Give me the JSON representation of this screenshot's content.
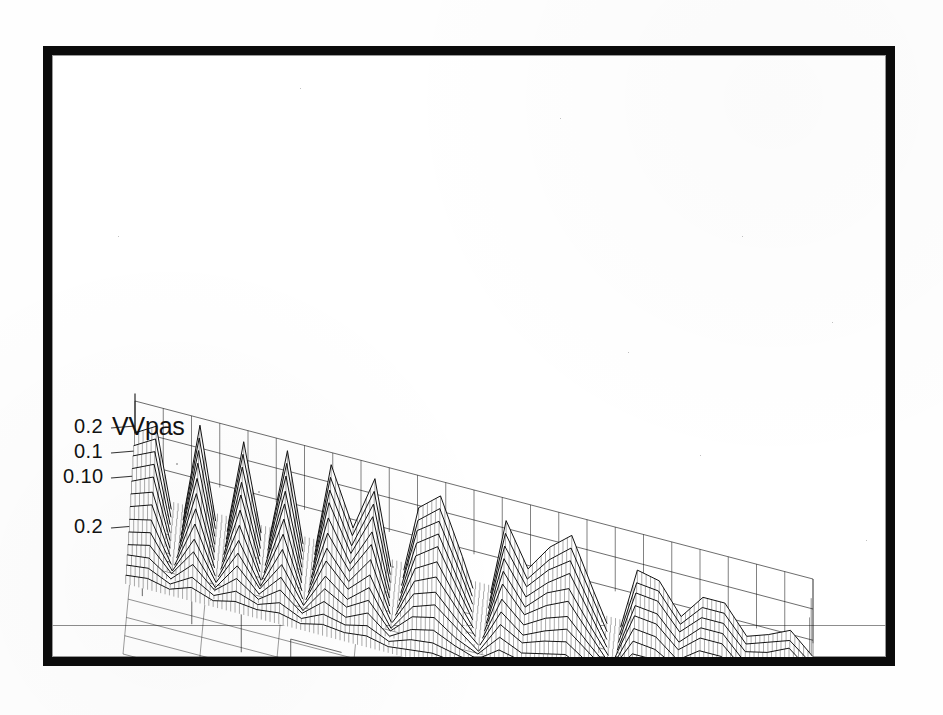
{
  "figure": {
    "axis_title": "VVpas",
    "frame_style": "thick-black-border",
    "background_color": "#ffffff",
    "ink_color": "#121212"
  },
  "chart_data": {
    "type": "line",
    "render_style": "3d-waterfall-mesh-surface",
    "title": "VVpas",
    "xlabel": "",
    "ylabel": "",
    "zlabel": "VVpas",
    "grid": true,
    "legend": "none",
    "projection": "oblique-3d",
    "z_axis": {
      "labels": [
        "0.2",
        "0.1",
        "0.10",
        "0.2"
      ],
      "values": [
        0.2,
        0.1,
        0.0,
        -0.2
      ],
      "zlim": [
        -0.2,
        0.2
      ]
    },
    "y_axis": {
      "labels": [
        "10",
        "20",
        "30",
        "40",
        "50",
        "60",
        "70",
        "80",
        "90",
        "100",
        "110",
        "120",
        "130"
      ],
      "values": [
        10,
        20,
        30,
        40,
        50,
        60,
        70,
        80,
        90,
        100,
        110,
        120,
        130
      ],
      "ylim": [
        10,
        130
      ],
      "tick_step": 10
    },
    "series_count": 13,
    "series": [
      {
        "name": "10",
        "values": [
          0.0,
          0.01,
          -0.01,
          0.02,
          -0.01,
          0.01,
          0.0,
          0.01,
          -0.01,
          0.01,
          0.0,
          0.01,
          -0.01,
          0.0,
          0.01,
          0.0,
          -0.01,
          0.01,
          0.0,
          0.0,
          0.01,
          0.0,
          -0.01,
          0.0,
          0.01,
          0.0,
          0.0,
          0.01,
          0.0,
          0.0,
          0.0,
          0.0
        ]
      },
      {
        "name": "20",
        "values": [
          0.01,
          0.02,
          -0.02,
          0.03,
          -0.02,
          0.02,
          -0.01,
          0.02,
          -0.02,
          0.02,
          0.0,
          0.02,
          -0.02,
          0.01,
          0.02,
          0.0,
          -0.02,
          0.02,
          0.0,
          0.01,
          0.02,
          0.0,
          -0.01,
          0.01,
          0.01,
          0.0,
          0.01,
          0.01,
          0.0,
          0.0,
          0.01,
          0.0
        ]
      },
      {
        "name": "30",
        "values": [
          0.02,
          0.03,
          -0.03,
          0.05,
          -0.03,
          0.04,
          -0.02,
          0.04,
          -0.03,
          0.04,
          0.0,
          0.04,
          -0.03,
          0.02,
          0.04,
          0.0,
          -0.03,
          0.03,
          0.01,
          0.02,
          0.03,
          0.0,
          -0.02,
          0.02,
          0.02,
          0.0,
          0.02,
          0.02,
          0.0,
          0.01,
          0.01,
          0.0
        ]
      },
      {
        "name": "40",
        "values": [
          0.03,
          0.05,
          -0.04,
          0.07,
          -0.05,
          0.06,
          -0.03,
          0.06,
          -0.05,
          0.06,
          0.01,
          0.06,
          -0.04,
          0.04,
          0.06,
          0.0,
          -0.04,
          0.05,
          0.01,
          0.03,
          0.05,
          0.01,
          -0.03,
          0.03,
          0.03,
          0.01,
          0.03,
          0.03,
          0.0,
          0.01,
          0.02,
          0.0
        ]
      },
      {
        "name": "50",
        "values": [
          0.05,
          0.07,
          -0.06,
          0.09,
          -0.06,
          0.08,
          -0.04,
          0.08,
          -0.06,
          0.08,
          0.01,
          0.08,
          -0.06,
          0.05,
          0.08,
          0.01,
          -0.06,
          0.07,
          0.02,
          0.05,
          0.07,
          0.01,
          -0.04,
          0.05,
          0.04,
          0.01,
          0.04,
          0.04,
          0.01,
          0.02,
          0.03,
          0.0
        ]
      },
      {
        "name": "60",
        "values": [
          0.07,
          0.09,
          -0.08,
          0.12,
          -0.08,
          0.1,
          -0.06,
          0.11,
          -0.08,
          0.11,
          0.02,
          0.1,
          -0.07,
          0.07,
          0.1,
          0.01,
          -0.07,
          0.09,
          0.02,
          0.06,
          0.09,
          0.02,
          -0.05,
          0.06,
          0.06,
          0.01,
          0.05,
          0.05,
          0.01,
          0.02,
          0.04,
          0.01
        ]
      },
      {
        "name": "70",
        "values": [
          0.09,
          0.12,
          -0.1,
          0.15,
          -0.1,
          0.13,
          -0.07,
          0.14,
          -0.1,
          0.13,
          0.02,
          0.13,
          -0.09,
          0.09,
          0.13,
          0.02,
          -0.09,
          0.11,
          0.03,
          0.08,
          0.11,
          0.02,
          -0.06,
          0.08,
          0.07,
          0.02,
          0.07,
          0.07,
          0.01,
          0.03,
          0.05,
          0.01
        ]
      },
      {
        "name": "80",
        "values": [
          0.11,
          0.14,
          -0.12,
          0.18,
          -0.12,
          0.16,
          -0.09,
          0.17,
          -0.12,
          0.16,
          0.03,
          0.16,
          -0.11,
          0.11,
          0.16,
          0.02,
          -0.11,
          0.14,
          0.04,
          0.1,
          0.14,
          0.03,
          -0.08,
          0.1,
          0.09,
          0.02,
          0.08,
          0.08,
          0.02,
          0.04,
          0.06,
          0.01
        ]
      },
      {
        "name": "90",
        "values": [
          0.13,
          0.17,
          -0.14,
          0.21,
          -0.14,
          0.19,
          -0.1,
          0.2,
          -0.14,
          0.19,
          0.03,
          0.18,
          -0.13,
          0.13,
          0.19,
          0.03,
          -0.13,
          0.16,
          0.04,
          0.12,
          0.16,
          0.03,
          -0.09,
          0.12,
          0.11,
          0.03,
          0.1,
          0.1,
          0.02,
          0.04,
          0.07,
          0.01
        ]
      },
      {
        "name": "100",
        "values": [
          0.15,
          0.19,
          -0.16,
          0.24,
          -0.16,
          0.21,
          -0.12,
          0.22,
          -0.16,
          0.22,
          0.04,
          0.21,
          -0.15,
          0.15,
          0.21,
          0.03,
          -0.15,
          0.18,
          0.05,
          0.13,
          0.19,
          0.04,
          -0.11,
          0.13,
          0.12,
          0.03,
          0.11,
          0.11,
          0.02,
          0.05,
          0.08,
          0.02
        ]
      },
      {
        "name": "110",
        "values": [
          0.17,
          0.21,
          -0.18,
          0.26,
          -0.18,
          0.24,
          -0.13,
          0.25,
          -0.18,
          0.24,
          0.04,
          0.23,
          -0.16,
          0.17,
          0.23,
          0.04,
          -0.16,
          0.2,
          0.06,
          0.15,
          0.21,
          0.04,
          -0.12,
          0.15,
          0.14,
          0.04,
          0.12,
          0.12,
          0.03,
          0.05,
          0.09,
          0.02
        ]
      },
      {
        "name": "120",
        "values": [
          0.18,
          0.23,
          -0.19,
          0.28,
          -0.19,
          0.26,
          -0.14,
          0.27,
          -0.19,
          0.26,
          0.05,
          0.25,
          -0.18,
          0.18,
          0.25,
          0.04,
          -0.18,
          0.22,
          0.06,
          0.16,
          0.23,
          0.05,
          -0.13,
          0.16,
          0.15,
          0.04,
          0.13,
          0.13,
          0.03,
          0.06,
          0.09,
          0.02
        ]
      },
      {
        "name": "130",
        "values": [
          0.2,
          0.25,
          -0.21,
          0.3,
          -0.21,
          0.28,
          -0.16,
          0.29,
          -0.21,
          0.28,
          0.05,
          0.27,
          -0.19,
          0.2,
          0.27,
          0.05,
          -0.19,
          0.24,
          0.07,
          0.18,
          0.25,
          0.05,
          -0.14,
          0.18,
          0.16,
          0.04,
          0.14,
          0.14,
          0.03,
          0.06,
          0.1,
          0.02
        ]
      }
    ]
  }
}
